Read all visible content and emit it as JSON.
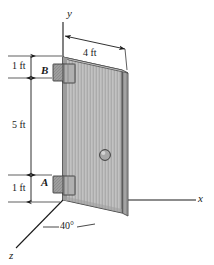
{
  "figure": {
    "kind": "engineering-statics-diagram"
  },
  "axes": {
    "y_label": "y",
    "x_label": "x",
    "z_label": "z"
  },
  "dimensions": {
    "top_gap": "1 ft",
    "hinge_span": "5 ft",
    "bottom_gap": "1 ft",
    "door_width": "4 ft",
    "open_angle": "40°"
  },
  "points": {
    "upper_hinge": "B",
    "lower_hinge": "A"
  },
  "colors": {
    "line": "#1a1a1a",
    "door_face": "#b9b9b9",
    "door_edge": "#8f8f8f",
    "hinge": "#9a9a9a",
    "knob": "#a8a8a8"
  }
}
